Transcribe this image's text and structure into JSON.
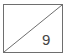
{
  "cell": {
    "value": "9",
    "border_color": "#6e6e6e",
    "diagonal": "bottom-left-to-top-right"
  }
}
